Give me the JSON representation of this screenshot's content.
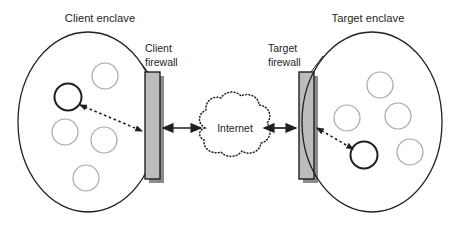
{
  "diagram": {
    "type": "network-architecture",
    "canvas": {
      "width": 459,
      "height": 238,
      "background": "#ffffff"
    },
    "labels": {
      "client_enclave": "Client enclave",
      "client_firewall_line1": "Client",
      "client_firewall_line2": "firewall",
      "target_enclave": "Target enclave",
      "target_firewall_line1": "Target",
      "target_firewall_line2": "firewall",
      "internet": "Internet"
    },
    "colors": {
      "outline": "#231f20",
      "text": "#231f20",
      "firewall_fill": "#bcbcbc",
      "firewall_stroke": "#231f20",
      "firewall_shadow": "#8c8c8c",
      "circle_inactive_stroke": "#a8a8a8",
      "circle_active_stroke": "#231f20",
      "cloud_stroke": "#231f20",
      "arrow_solid": "#231f20",
      "arrow_dashed": "#231f20"
    },
    "client_enclave": {
      "shape": "ellipse",
      "cx": 88,
      "cy": 122,
      "rx": 70,
      "ry": 90,
      "hosts": [
        {
          "id": "client-host-1",
          "cx": 68,
          "cy": 97,
          "r": 13,
          "state": "active"
        },
        {
          "id": "client-host-2",
          "cx": 105,
          "cy": 76,
          "r": 13,
          "state": "inactive"
        },
        {
          "id": "client-host-3",
          "cx": 65,
          "cy": 132,
          "r": 13,
          "state": "inactive"
        },
        {
          "id": "client-host-4",
          "cx": 104,
          "cy": 140,
          "r": 13,
          "state": "inactive"
        },
        {
          "id": "client-host-5",
          "cx": 86,
          "cy": 178,
          "r": 13,
          "state": "inactive"
        }
      ]
    },
    "target_enclave": {
      "shape": "ellipse",
      "cx": 372,
      "cy": 122,
      "rx": 70,
      "ry": 90,
      "hosts": [
        {
          "id": "target-host-1",
          "cx": 380,
          "cy": 85,
          "r": 13,
          "state": "inactive"
        },
        {
          "id": "target-host-2",
          "cx": 347,
          "cy": 118,
          "r": 13,
          "state": "inactive"
        },
        {
          "id": "target-host-3",
          "cx": 398,
          "cy": 116,
          "r": 13,
          "state": "inactive"
        },
        {
          "id": "target-host-4",
          "cx": 364,
          "cy": 155,
          "r": 13,
          "state": "active"
        },
        {
          "id": "target-host-5",
          "cx": 410,
          "cy": 152,
          "r": 13,
          "state": "inactive"
        }
      ]
    },
    "client_firewall": {
      "x": 145,
      "y": 72,
      "width": 15,
      "height": 107
    },
    "target_firewall": {
      "x": 299,
      "y": 72,
      "width": 15,
      "height": 107
    },
    "internet_cloud": {
      "cx": 232,
      "cy": 128,
      "rx": 41,
      "ry": 33
    },
    "connections": [
      {
        "id": "client-host-to-firewall",
        "style": "dashed",
        "heads": "both"
      },
      {
        "id": "client-firewall-to-internet",
        "style": "solid",
        "heads": "both"
      },
      {
        "id": "internet-to-target-firewall",
        "style": "solid",
        "heads": "both"
      },
      {
        "id": "target-firewall-to-host",
        "style": "dashed",
        "heads": "both"
      }
    ]
  }
}
